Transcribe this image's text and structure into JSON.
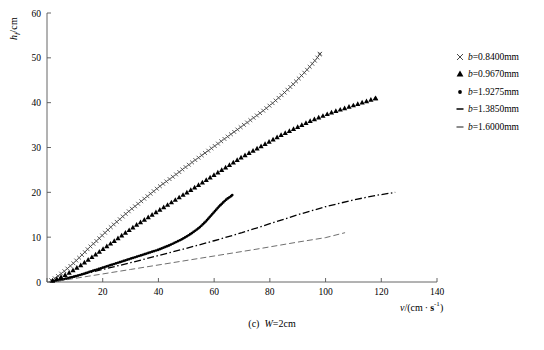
{
  "figure": {
    "caption_prefix": "(c)",
    "caption_var": "W",
    "caption_rest": "=2cm",
    "caption_full": "(c) W=2cm"
  },
  "axes": {
    "ylabel_main": "h",
    "ylabel_sub": "f",
    "ylabel_unit": "/cm",
    "xlabel_var": "v",
    "xlabel_open": "/(cm",
    "xlabel_dot": "·",
    "xlabel_unit": "s",
    "xlabel_sup": "-1",
    "xlabel_close": ")",
    "xticks": [
      "0",
      "20",
      "40",
      "60",
      "80",
      "100",
      "120",
      "140"
    ],
    "yticks": [
      "0",
      "10",
      "20",
      "30",
      "40",
      "50",
      "60"
    ]
  },
  "legend": {
    "entries": [
      {
        "marker": "cross",
        "var": "b",
        "value": "=0.8400mm",
        "label": "b=0.8400mm"
      },
      {
        "marker": "triangle",
        "var": "b",
        "value": "=0.9670mm",
        "label": "b=0.9670mm"
      },
      {
        "marker": "dot",
        "var": "b",
        "value": "=1.9275mm",
        "label": "b=1.9275mm"
      },
      {
        "marker": "dashdot",
        "var": "b",
        "value": "=1.3850mm",
        "label": "b=1.3850mm"
      },
      {
        "marker": "dash",
        "var": "b",
        "value": "=1.6000mm",
        "label": "b=1.6000mm"
      }
    ]
  },
  "chart_data": {
    "type": "scatter",
    "xlabel": "v/(cm · s^-1)",
    "ylabel": "h_f/cm",
    "xlim": [
      0,
      140
    ],
    "ylim": [
      0,
      60
    ],
    "xticks": [
      0,
      20,
      40,
      60,
      80,
      100,
      120,
      140
    ],
    "yticks": [
      0,
      10,
      20,
      30,
      40,
      50,
      60
    ],
    "grid": false,
    "legend_position": "right-outside-top",
    "series": [
      {
        "name": "b=0.8400mm",
        "marker": "cross",
        "color": "#333333",
        "points": [
          [
            1.5,
            0.4
          ],
          [
            3,
            0.9
          ],
          [
            4.5,
            1.6
          ],
          [
            6,
            2.3
          ],
          [
            7.5,
            3.1
          ],
          [
            9,
            3.9
          ],
          [
            10.5,
            4.8
          ],
          [
            12,
            5.7
          ],
          [
            13.5,
            6.6
          ],
          [
            15,
            7.6
          ],
          [
            17,
            8.7
          ],
          [
            19,
            9.9
          ],
          [
            21,
            11.1
          ],
          [
            23,
            12.3
          ],
          [
            25,
            13.4
          ],
          [
            27,
            14.5
          ],
          [
            29,
            15.6
          ],
          [
            31,
            16.6
          ],
          [
            33,
            17.6
          ],
          [
            35,
            18.6
          ],
          [
            37,
            19.6
          ],
          [
            39,
            20.6
          ],
          [
            41,
            21.6
          ],
          [
            43,
            22.5
          ],
          [
            45,
            23.4
          ],
          [
            47,
            24.3
          ],
          [
            49,
            25.3
          ],
          [
            51,
            26.2
          ],
          [
            53,
            27.1
          ],
          [
            55,
            28.0
          ],
          [
            57,
            28.9
          ],
          [
            59,
            29.8
          ],
          [
            61,
            30.7
          ],
          [
            63,
            31.6
          ],
          [
            65,
            32.5
          ],
          [
            67,
            33.4
          ],
          [
            69,
            34.3
          ],
          [
            71,
            35.2
          ],
          [
            73,
            36.1
          ],
          [
            75,
            37.0
          ],
          [
            77,
            37.9
          ],
          [
            79,
            38.9
          ],
          [
            81,
            39.9
          ],
          [
            83,
            41.0
          ],
          [
            85,
            42.1
          ],
          [
            87,
            43.3
          ],
          [
            89,
            44.5
          ],
          [
            91,
            45.8
          ],
          [
            93,
            47.1
          ],
          [
            95,
            48.5
          ],
          [
            97,
            50.0
          ],
          [
            98,
            50.9
          ]
        ]
      },
      {
        "name": "b=0.9670mm",
        "marker": "triangle",
        "color": "#000000",
        "points": [
          [
            2,
            0.3
          ],
          [
            4,
            0.8
          ],
          [
            6,
            1.4
          ],
          [
            8,
            2.1
          ],
          [
            10,
            2.9
          ],
          [
            12,
            3.7
          ],
          [
            14,
            4.6
          ],
          [
            16,
            5.5
          ],
          [
            18,
            6.4
          ],
          [
            20,
            7.3
          ],
          [
            22,
            8.2
          ],
          [
            24,
            9.1
          ],
          [
            26,
            10.0
          ],
          [
            28,
            10.9
          ],
          [
            30,
            11.8
          ],
          [
            32,
            12.7
          ],
          [
            34,
            13.5
          ],
          [
            36,
            14.3
          ],
          [
            38,
            15.1
          ],
          [
            40,
            15.9
          ],
          [
            42,
            16.7
          ],
          [
            44,
            17.5
          ],
          [
            46,
            18.3
          ],
          [
            48,
            19.1
          ],
          [
            50,
            19.9
          ],
          [
            52,
            20.7
          ],
          [
            54,
            21.5
          ],
          [
            56,
            22.3
          ],
          [
            58,
            23.1
          ],
          [
            60,
            23.9
          ],
          [
            62,
            24.7
          ],
          [
            64,
            25.5
          ],
          [
            66,
            26.3
          ],
          [
            68,
            27.1
          ],
          [
            70,
            27.9
          ],
          [
            72,
            28.6
          ],
          [
            74,
            29.3
          ],
          [
            76,
            30.0
          ],
          [
            78,
            30.7
          ],
          [
            80,
            31.4
          ],
          [
            82,
            32.1
          ],
          [
            84,
            32.8
          ],
          [
            86,
            33.4
          ],
          [
            88,
            34.0
          ],
          [
            90,
            34.6
          ],
          [
            92,
            35.2
          ],
          [
            94,
            35.8
          ],
          [
            96,
            36.3
          ],
          [
            98,
            36.8
          ],
          [
            100,
            37.3
          ],
          [
            102,
            37.8
          ],
          [
            104,
            38.2
          ],
          [
            106,
            38.6
          ],
          [
            108,
            39.0
          ],
          [
            110,
            39.4
          ],
          [
            112,
            39.8
          ],
          [
            114,
            40.2
          ],
          [
            116,
            40.6
          ],
          [
            118,
            41.0
          ]
        ]
      },
      {
        "name": "b=1.9275mm",
        "marker": "dot",
        "color": "#000000",
        "points": [
          [
            2,
            0.2
          ],
          [
            5,
            0.5
          ],
          [
            8,
            0.9
          ],
          [
            11,
            1.4
          ],
          [
            14,
            2.0
          ],
          [
            17,
            2.6
          ],
          [
            20,
            3.2
          ],
          [
            23,
            3.8
          ],
          [
            26,
            4.4
          ],
          [
            29,
            5.0
          ],
          [
            32,
            5.6
          ],
          [
            35,
            6.2
          ],
          [
            38,
            6.8
          ],
          [
            40,
            7.2
          ],
          [
            42,
            7.7
          ],
          [
            44,
            8.2
          ],
          [
            46,
            8.8
          ],
          [
            48,
            9.4
          ],
          [
            50,
            10.1
          ],
          [
            52,
            10.9
          ],
          [
            54,
            11.8
          ],
          [
            55,
            12.3
          ],
          [
            56,
            12.9
          ],
          [
            57,
            13.5
          ],
          [
            58,
            14.2
          ],
          [
            59,
            14.9
          ],
          [
            60,
            15.6
          ],
          [
            61,
            16.3
          ],
          [
            62,
            17.0
          ],
          [
            63,
            17.6
          ],
          [
            64,
            18.2
          ],
          [
            65,
            18.7
          ],
          [
            66,
            19.1
          ],
          [
            66.5,
            19.4
          ]
        ]
      },
      {
        "name": "b=1.3850mm",
        "marker": "dashdot",
        "color": "#000000",
        "points": [
          [
            3,
            0.3
          ],
          [
            10,
            1.3
          ],
          [
            20,
            2.8
          ],
          [
            30,
            4.3
          ],
          [
            40,
            5.9
          ],
          [
            50,
            7.5
          ],
          [
            60,
            9.2
          ],
          [
            70,
            11.0
          ],
          [
            80,
            13.0
          ],
          [
            90,
            15.0
          ],
          [
            100,
            16.8
          ],
          [
            110,
            18.3
          ],
          [
            118,
            19.3
          ],
          [
            125,
            20.0
          ]
        ]
      },
      {
        "name": "b=1.6000mm",
        "marker": "dash",
        "color": "#555555",
        "points": [
          [
            4,
            0.2
          ],
          [
            15,
            1.3
          ],
          [
            30,
            2.8
          ],
          [
            45,
            4.3
          ],
          [
            60,
            5.8
          ],
          [
            75,
            7.3
          ],
          [
            90,
            8.9
          ],
          [
            100,
            9.9
          ],
          [
            107,
            11.0
          ]
        ]
      }
    ]
  }
}
